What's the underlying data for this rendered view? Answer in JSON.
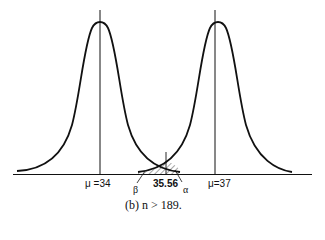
{
  "figure": {
    "caption": "(b) n > 189.",
    "distributions": [
      {
        "name": "null",
        "mean_label": "μ =34",
        "mean": 34
      },
      {
        "name": "alternative",
        "mean_label": "μ=37",
        "mean": 37
      }
    ],
    "critical_value_label": "35.56",
    "critical_value": 35.56,
    "beta_label": "β",
    "alpha_label": "α",
    "colors": {
      "stroke": "#111111",
      "hatch": "#222222",
      "background": "#ffffff"
    }
  }
}
